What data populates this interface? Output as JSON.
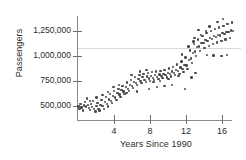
{
  "chart_data": {
    "type": "scatter",
    "title": "",
    "xlabel": "Years Since 1990",
    "ylabel": "Passengers",
    "xlim": [
      -0.5,
      17.5
    ],
    "ylim": [
      420000,
      1420000
    ],
    "xticks": [
      4,
      8,
      12,
      16
    ],
    "xtick_labels": [
      "4",
      "8",
      "12",
      "16"
    ],
    "yticks": [
      500000,
      750000,
      1000000,
      1250000
    ],
    "ytick_labels": [
      "500,000",
      "750,000",
      "1,000,000",
      "1,250,000"
    ],
    "grid": true,
    "gridlines_y": [
      1080000
    ],
    "legend": null,
    "marker_color": "#4a4a4a",
    "axis_color": "#8a8a8a",
    "points": [
      [
        0.05,
        497000
      ],
      [
        0.15,
        470000
      ],
      [
        0.28,
        520000
      ],
      [
        0.4,
        487000
      ],
      [
        0.52,
        455000
      ],
      [
        0.63,
        505000
      ],
      [
        0.75,
        540000
      ],
      [
        0.86,
        497000
      ],
      [
        0.98,
        575000
      ],
      [
        1.1,
        510000
      ],
      [
        1.22,
        478000
      ],
      [
        1.33,
        462000
      ],
      [
        1.45,
        520000
      ],
      [
        1.56,
        492000
      ],
      [
        1.68,
        548000
      ],
      [
        1.8,
        468000
      ],
      [
        1.92,
        445000
      ],
      [
        2.03,
        500000
      ],
      [
        2.15,
        530000
      ],
      [
        2.27,
        470000
      ],
      [
        2.38,
        455000
      ],
      [
        2.5,
        512000
      ],
      [
        2.62,
        560000
      ],
      [
        2.73,
        498000
      ],
      [
        2.85,
        472000
      ],
      [
        2.97,
        540000
      ],
      [
        3.08,
        588000
      ],
      [
        3.2,
        518000
      ],
      [
        3.32,
        495000
      ],
      [
        3.43,
        565000
      ],
      [
        3.55,
        620000
      ],
      [
        3.67,
        552000
      ],
      [
        3.78,
        530000
      ],
      [
        3.9,
        600000
      ],
      [
        4.02,
        648000
      ],
      [
        4.13,
        585000
      ],
      [
        4.25,
        560000
      ],
      [
        4.37,
        628000
      ],
      [
        4.48,
        672000
      ],
      [
        4.6,
        615000
      ],
      [
        4.72,
        592000
      ],
      [
        4.83,
        660000
      ],
      [
        4.95,
        700000
      ],
      [
        5.07,
        645000
      ],
      [
        5.18,
        622000
      ],
      [
        5.3,
        690000
      ],
      [
        5.42,
        735000
      ],
      [
        5.53,
        672000
      ],
      [
        5.65,
        650000
      ],
      [
        5.77,
        712000
      ],
      [
        5.88,
        760000
      ],
      [
        6.0,
        700000
      ],
      [
        6.12,
        680000
      ],
      [
        6.23,
        742000
      ],
      [
        6.35,
        790000
      ],
      [
        6.47,
        730000
      ],
      [
        6.58,
        708000
      ],
      [
        6.7,
        768000
      ],
      [
        6.82,
        812000
      ],
      [
        6.93,
        752000
      ],
      [
        7.05,
        730000
      ],
      [
        7.17,
        788000
      ],
      [
        7.28,
        818000
      ],
      [
        7.4,
        762000
      ],
      [
        7.52,
        742000
      ],
      [
        7.63,
        795000
      ],
      [
        7.75,
        830000
      ],
      [
        7.87,
        775000
      ],
      [
        7.98,
        752000
      ],
      [
        8.1,
        800000
      ],
      [
        8.22,
        838000
      ],
      [
        8.33,
        782000
      ],
      [
        8.45,
        760000
      ],
      [
        8.57,
        808000
      ],
      [
        8.68,
        845000
      ],
      [
        8.8,
        790000
      ],
      [
        8.92,
        770000
      ],
      [
        9.03,
        815000
      ],
      [
        9.15,
        852000
      ],
      [
        9.27,
        798000
      ],
      [
        9.38,
        778000
      ],
      [
        9.5,
        822000
      ],
      [
        9.62,
        862000
      ],
      [
        9.73,
        808000
      ],
      [
        9.85,
        785000
      ],
      [
        9.97,
        832000
      ],
      [
        10.08,
        875000
      ],
      [
        10.2,
        818000
      ],
      [
        10.32,
        795000
      ],
      [
        10.43,
        845000
      ],
      [
        10.55,
        892000
      ],
      [
        10.67,
        832000
      ],
      [
        10.78,
        808000
      ],
      [
        10.9,
        862000
      ],
      [
        11.02,
        915000
      ],
      [
        11.13,
        852000
      ],
      [
        11.25,
        822000
      ],
      [
        11.37,
        885000
      ],
      [
        11.48,
        945000
      ],
      [
        11.6,
        872000
      ],
      [
        11.72,
        842000
      ],
      [
        11.83,
        912000
      ],
      [
        11.95,
        985000
      ],
      [
        12.07,
        905000
      ],
      [
        12.18,
        868000
      ],
      [
        12.3,
        960000
      ],
      [
        12.42,
        1055000
      ],
      [
        12.53,
        975000
      ],
      [
        12.65,
        930000
      ],
      [
        12.77,
        1030000
      ],
      [
        12.88,
        1120000
      ],
      [
        13.0,
        1045000
      ],
      [
        13.12,
        1000000
      ],
      [
        13.23,
        1090000
      ],
      [
        13.35,
        1165000
      ],
      [
        13.47,
        1095000
      ],
      [
        13.58,
        1050000
      ],
      [
        13.7,
        1132000
      ],
      [
        13.82,
        1200000
      ],
      [
        13.93,
        1128000
      ],
      [
        14.05,
        1078000
      ],
      [
        14.17,
        1158000
      ],
      [
        14.28,
        1228000
      ],
      [
        14.4,
        1148000
      ],
      [
        14.52,
        1100000
      ],
      [
        14.63,
        1182000
      ],
      [
        14.75,
        1252000
      ],
      [
        14.87,
        1172000
      ],
      [
        14.98,
        1118000
      ],
      [
        15.1,
        1198000
      ],
      [
        15.22,
        1268000
      ],
      [
        15.33,
        1188000
      ],
      [
        15.45,
        1135000
      ],
      [
        15.57,
        1212000
      ],
      [
        15.68,
        1285000
      ],
      [
        15.8,
        1205000
      ],
      [
        15.92,
        1152000
      ],
      [
        16.03,
        1228000
      ],
      [
        16.15,
        1302000
      ],
      [
        16.27,
        1222000
      ],
      [
        16.38,
        1165000
      ],
      [
        16.5,
        1242000
      ],
      [
        16.62,
        1318000
      ],
      [
        16.73,
        1238000
      ],
      [
        16.85,
        1180000
      ],
      [
        16.97,
        1255000
      ],
      [
        17.08,
        1335000
      ],
      [
        17.2,
        1248000
      ],
      [
        11.9,
        668000
      ],
      [
        12.6,
        785000
      ],
      [
        13.05,
        830000
      ],
      [
        12.95,
        1180000
      ],
      [
        14.35,
        1010000
      ],
      [
        15.05,
        1005000
      ],
      [
        15.95,
        1000000
      ],
      [
        16.55,
        1008000
      ],
      [
        13.4,
        1262000
      ],
      [
        14.6,
        1295000
      ],
      [
        15.5,
        1340000
      ],
      [
        16.1,
        1368000
      ],
      [
        10.45,
        710000
      ],
      [
        9.6,
        700000
      ],
      [
        8.75,
        688000
      ],
      [
        7.9,
        670000
      ],
      [
        6.55,
        645000
      ],
      [
        5.4,
        628000
      ],
      [
        4.55,
        712000
      ],
      [
        3.95,
        688000
      ],
      [
        5.95,
        808000
      ],
      [
        6.85,
        845000
      ],
      [
        7.6,
        858000
      ],
      [
        8.4,
        742000
      ],
      [
        9.1,
        748000
      ],
      [
        10.05,
        768000
      ],
      [
        11.15,
        800000
      ],
      [
        11.55,
        1015000
      ],
      [
        12.25,
        1095000
      ],
      [
        12.85,
        1145000
      ],
      [
        13.65,
        1212000
      ],
      [
        14.2,
        1248000
      ],
      [
        2.05,
        585000
      ],
      [
        2.7,
        612000
      ],
      [
        3.35,
        640000
      ],
      [
        1.35,
        552000
      ]
    ]
  }
}
